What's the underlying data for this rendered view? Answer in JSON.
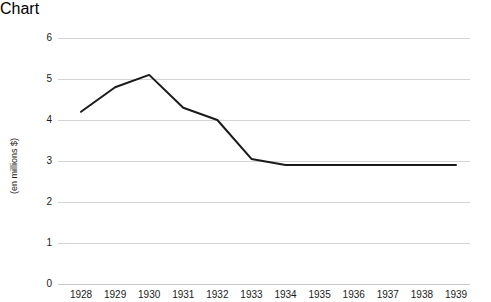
{
  "chart_data": {
    "type": "line",
    "title": "",
    "subtitle": "",
    "xlabel": "",
    "ylabel": "(en millions $)",
    "categories": [
      "1928",
      "1929",
      "1930",
      "1931",
      "1932",
      "1933",
      "1934",
      "1935",
      "1936",
      "1937",
      "1938",
      "1939"
    ],
    "values": [
      4.2,
      4.8,
      5.1,
      4.3,
      4.0,
      3.05,
      2.9,
      2.9,
      2.9,
      2.9,
      2.9,
      2.9
    ],
    "series": [
      {
        "name": "",
        "values": [
          4.2,
          4.8,
          5.1,
          4.3,
          4.0,
          3.05,
          2.9,
          2.9,
          2.9,
          2.9,
          2.9,
          2.9
        ]
      }
    ],
    "ylim": [
      0,
      6
    ],
    "yticks": [
      0,
      1,
      2,
      3,
      4,
      5,
      6
    ],
    "ytick_labels": [
      "0",
      "1",
      "2",
      "3",
      "4",
      "5",
      "6"
    ],
    "grid": "horizontal",
    "legend": "none",
    "line_color": "#1a1a1a",
    "line_width": 2,
    "gridline_color": "#d4d4d4",
    "markers": "none",
    "annotations": []
  }
}
